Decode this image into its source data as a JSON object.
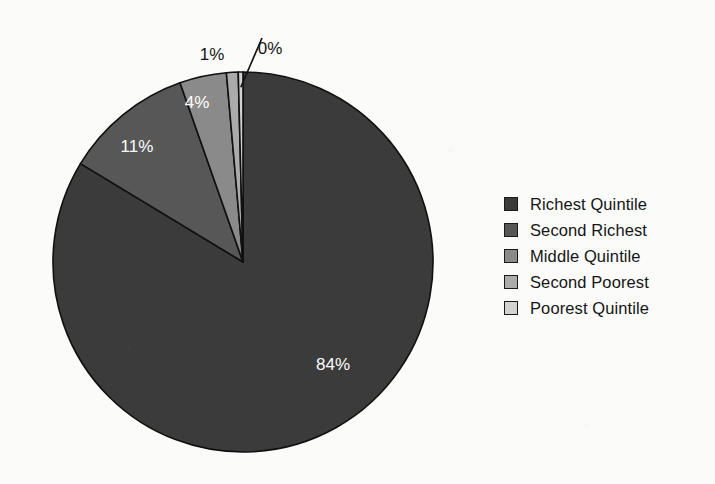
{
  "chart_data": {
    "type": "pie",
    "title": "",
    "subtitle": "",
    "xlabel": "",
    "ylabel": "",
    "grid": false,
    "legend_position": "right",
    "start_angle_deg": 0,
    "direction": "clockwise",
    "categories": [
      "Richest Quintile",
      "Second Richest",
      "Middle Quintile",
      "Second Poorest",
      "Poorest Quintile"
    ],
    "values": [
      84,
      11,
      4,
      1,
      0
    ],
    "value_labels": [
      "84%",
      "11%",
      "4%",
      "1%",
      "0%"
    ],
    "colors": [
      "#3b3b3b",
      "#575757",
      "#8a8a8a",
      "#ababab",
      "#d2d2d2"
    ],
    "slice_border_color": "#101010",
    "slices": [
      {
        "name": "Richest Quintile",
        "value": 84,
        "label": "84%",
        "color": "#3b3b3b",
        "label_placement": "inside",
        "label_color": "#ffffff",
        "label_x": 333,
        "label_y": 366
      },
      {
        "name": "Second Richest",
        "value": 11,
        "label": "11%",
        "color": "#575757",
        "label_placement": "inside",
        "label_color": "#ffffff",
        "label_x": 137,
        "label_y": 148
      },
      {
        "name": "Middle Quintile",
        "value": 4,
        "label": "4%",
        "color": "#8a8a8a",
        "label_placement": "inside",
        "label_color": "#ffffff",
        "label_x": 197,
        "label_y": 104
      },
      {
        "name": "Second Poorest",
        "value": 1,
        "label": "1%",
        "color": "#ababab",
        "label_placement": "outside",
        "label_color": "#141414",
        "label_x": 212,
        "label_y": 56
      },
      {
        "name": "Poorest Quintile",
        "value": 0.4,
        "label": "0%",
        "color": "#d2d2d2",
        "label_placement": "outside-leader",
        "label_color": "#141414",
        "label_x": 270,
        "label_y": 50
      }
    ]
  },
  "legend": {
    "items": [
      {
        "label": "Richest Quintile",
        "color": "#3b3b3b"
      },
      {
        "label": "Second Richest",
        "color": "#575757"
      },
      {
        "label": "Middle Quintile",
        "color": "#8a8a8a"
      },
      {
        "label": "Second Poorest",
        "color": "#ababab"
      },
      {
        "label": "Poorest Quintile",
        "color": "#d2d2d2"
      }
    ]
  },
  "geometry": {
    "center_x": 243,
    "center_y": 262,
    "radius": 190
  }
}
